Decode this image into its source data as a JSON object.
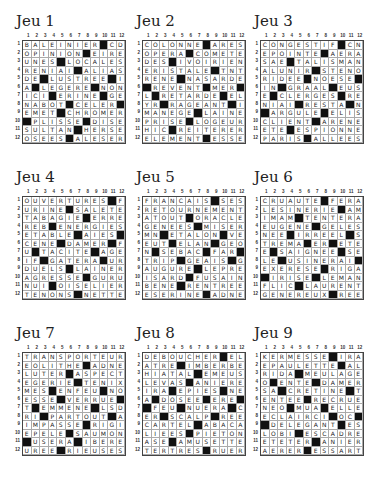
{
  "page": {
    "column_numbers": [
      "1",
      "2",
      "3",
      "4",
      "5",
      "6",
      "7",
      "8",
      "9",
      "10",
      "11",
      "12"
    ]
  },
  "puzzles": [
    {
      "title": "Jeu 1",
      "rows": [
        "BALEINIER#CD",
        "OPINION#EIRE",
        "UNES#LOCALES",
        "RENIAI#ALIAS",
        "DE#LUSTREE#I",
        "A#LEGERE#NON",
        "ICI#ERINE#GE",
        "NABOT#CELER#",
        "EMET#CHROMER",
        "#PLISSE#DISE",
        "SULTAN#HERSE",
        "OSEES#ALESER"
      ]
    },
    {
      "title": "Jeu 2",
      "rows": [
        "COLONNE#ARES",
        "OPERA#COMETE",
        "DES#IVOIRIEN",
        "ERISTALE#TNT",
        "RENE#NASARDE",
        "#REVENT#MER#",
        "L#RETARDE#EL",
        "YR#RAGEANT#I",
        "MANEGE#LAINE",
        "PRISE#LOGEUR",
        "HIC#REITERER",
        "ELEMENT#ESSE"
      ]
    },
    {
      "title": "Jeu 3",
      "rows": [
        "CONGESTIF#CN",
        "EPOINTE#AERA",
        "SAE#TALISMAN",
        "ALUNIR#STENO",
        "RIDEE#NOESE#",
        "IN#GRAAL#EUS",
        "E#CLERGES#RE",
        "NIAI#RESTA#N",
        "#ARGULE#ELIS",
        "CLIENT#ARENE",
        "ETE#ESPIONNE",
        "PARIS#ALLEES"
      ]
    },
    {
      "title": "Jeu 4",
      "rows": [
        "OUVERTURES#F",
        "URINE#SALETE",
        "TABAGIE#ERRE",
        "REB#ENERGIES",
        "ETABLE#AIES#",
        "CENE#DAMER#F",
        "U#TACITE#AGE",
        "IF#GATERA#UR",
        "DUELS#LAINER",
        "AGRESSE#GURU",
        "NUI#OISELIER",
        "TENONS#NETTE"
      ]
    },
    {
      "title": "Jeu 5",
      "rows": [
        "FRANCAIS#SES",
        "RETOURNEMENT",
        "ATOUT#ORACLE",
        "GENEES#MISER",
        "MN#ETALON#VE",
        "EUT#ELAN#GEO",
        "N#SEBAC#FAR#",
        "TRIP#GEAIS#G",
        "AUGURE#LEPRE",
        "ISARD#FUSAIN",
        "BENE#RENTREE",
        "ESERINE#ADNE"
      ]
    },
    {
      "title": "Jeu 6",
      "rows": [
        "CRUAUTE#FERA",
        "LESINERIE#AM",
        "IMAM#TENTERA",
        "EUGENE#GELES",
        "NEE#IRREEL#S",
        "TREMA#ER#ETE",
        "E#SAIGNEE#SE",
        "LE#USINERAI#",
        "EXERESE#RIGA",
        "#IRISE#LEMAN",
        "FLIC#LAURENT",
        "GENEREUX#REE"
      ]
    },
    {
      "title": "Jeu 7",
      "rows": [
        "TRANSPORTEUR",
        "EOLITHE#ADNE",
        "LUTER#ASPECT",
        "EGERIE#TENIX",
        "MES#ENFEU#NO",
        "ESSE#VERRUE#",
        "T#EMMENE#LSD",
        "RI#PARTOUT#A",
        "IMPASSE#RIGI",
        "EPELE#SAUMON",
        "#USERA#IBERE",
        "UREE#RIEUSES"
      ]
    },
    {
      "title": "Jeu 8",
      "rows": [
        "DEBOUCHER#EL",
        "ATRE#IMBERBE",
        "HIATAL#EMEUS",
        "LEVAS#ANIERE",
        "IRA#EPIES#NE",
        "A#DOSEE#ERE#",
        "#FEU#NUERA#C",
        "ER#SCALP#REE",
        "CARTEL#ABACA",
        "LIEES#PIETON",
        "ASE#AMUSETTE",
        "TERTRES#RUER"
      ]
    },
    {
      "title": "Jeu 9",
      "rows": [
        "KERMESSE#IRA",
        "EPAULETTE#AL",
        "RIDA#MEULAGE",
        "O#ENTE#DAMER",
        "SA#CRETINE#T",
        "ENTEE#RECRUE",
        "NEO#MUA#ELLE",
        "ECLAIRCI#OC#",
        "#DELEGANT#ES",
        "LOBI#ESCADRE",
        "ETETER#ANIER",
        "AERER#ESSART"
      ]
    }
  ]
}
